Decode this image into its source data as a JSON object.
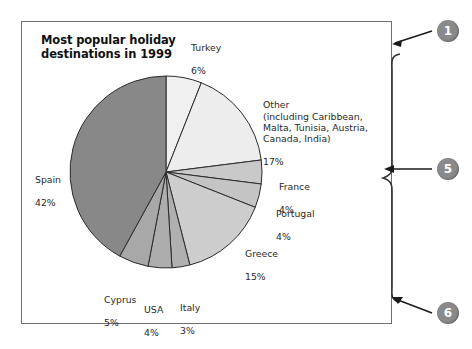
{
  "figure": {
    "title": "Most popular holiday\ndestinations in 1999",
    "frame_border_color": "#6f6f6f",
    "background": "#ffffff"
  },
  "chart_data": {
    "type": "pie",
    "title": "Most popular holiday destinations in 1999",
    "xlabel": "",
    "ylabel": "",
    "legend": "none (direct slice labels)",
    "grid": false,
    "value_unit": "percent",
    "categories": [
      "Turkey",
      "Other (including Caribbean, Malta, Tunisia, Austria, Canada, India)",
      "France",
      "Portugal",
      "Greece",
      "Italy",
      "USA",
      "Cyprus",
      "Spain"
    ],
    "values": [
      6,
      17,
      4,
      4,
      15,
      3,
      4,
      5,
      42
    ],
    "slices": [
      {
        "label": "Turkey",
        "label_text": "Turkey",
        "value_text": "6%",
        "value": 6,
        "color": "#f0f0f0"
      },
      {
        "label": "Other",
        "label_text": "Other\n(including Caribbean,\nMalta, Tunisia, Austria,\nCanada, India)",
        "value_text": "17%",
        "value": 17,
        "color": "#ededed"
      },
      {
        "label": "France",
        "label_text": "France",
        "value_text": "4%",
        "value": 4,
        "color": "#c9c9c9"
      },
      {
        "label": "Portugal",
        "label_text": "Portugal",
        "value_text": "4%",
        "value": 4,
        "color": "#c4c4c4"
      },
      {
        "label": "Greece",
        "label_text": "Greece",
        "value_text": "15%",
        "value": 15,
        "color": "#cdcdcd"
      },
      {
        "label": "Italy",
        "label_text": "Italy",
        "value_text": "3%",
        "value": 3,
        "color": "#b0b0b0"
      },
      {
        "label": "USA",
        "label_text": "USA",
        "value_text": "4%",
        "value": 4,
        "color": "#adadad"
      },
      {
        "label": "Cyprus",
        "label_text": "Cyprus",
        "value_text": "5%",
        "value": 5,
        "color": "#a8a8a8"
      },
      {
        "label": "Spain",
        "label_text": "Spain",
        "value_text": "42%",
        "value": 42,
        "color": "#888888"
      }
    ],
    "start_angle_deg": 0,
    "direction": "clockwise",
    "total": 100
  },
  "labels": {
    "turkey": {
      "name": "Turkey",
      "pct": "6%"
    },
    "other": {
      "name": "Other\n(including Caribbean,\nMalta, Tunisia, Austria,\nCanada, India)",
      "pct": "17%"
    },
    "france": {
      "name": "France",
      "pct": "4%"
    },
    "portugal": {
      "name": "Portugal",
      "pct": "4%"
    },
    "greece": {
      "name": "Greece",
      "pct": "15%"
    },
    "italy": {
      "name": "Italy",
      "pct": "3%"
    },
    "usa": {
      "name": "USA",
      "pct": "4%"
    },
    "cyprus": {
      "name": "Cyprus",
      "pct": "5%"
    },
    "spain": {
      "name": "Spain",
      "pct": "42%"
    }
  },
  "annotations": {
    "markers": [
      {
        "id": "1",
        "label": "1",
        "points_to": "chart-frame-top-right",
        "color": "#8a8a8a"
      },
      {
        "id": "5",
        "label": "5",
        "points_to": "brace-midpoint",
        "color": "#8a8a8a"
      },
      {
        "id": "6",
        "label": "6",
        "points_to": "chart-frame-bottom-right",
        "color": "#8a8a8a"
      }
    ],
    "brace": {
      "name": "right-curly-brace",
      "color": "#333333"
    }
  }
}
